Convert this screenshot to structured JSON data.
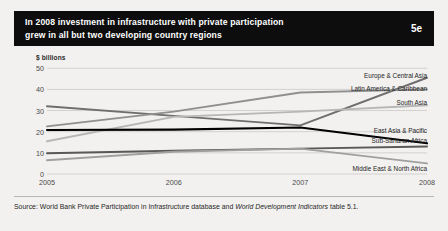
{
  "header": {
    "title": "In 2008 investment in infrastructure with private participation\ngrew in all but two developing country regions",
    "badge": "5e"
  },
  "footer": {
    "source_prefix": "Source: World Bank Private Participation in Infrastructure database and ",
    "source_italic": "World Development Indicators",
    "source_suffix": " table 5.1."
  },
  "colors": {
    "page_background": "#f2f1ef",
    "banner": "#0d0d0d",
    "gridline": "#d3d1ce",
    "axis_text": "#4a4a4a",
    "east_asia_pacific": "#000000",
    "europe_central_asia": "#6e6e6e",
    "latin_america_caribbean": "#8f8f8f",
    "south_asia": "#b6b6b6",
    "sub_saharan_africa": "#585858",
    "middle_east_north_africa": "#a0a0a0"
  },
  "chart_data": {
    "type": "line",
    "title": "In 2008 investment in infrastructure with private participation grew in all but two developing country regions",
    "xlabel": "",
    "ylabel": "$ billions",
    "x": [
      2005,
      2006,
      2007,
      2008
    ],
    "xticklabels": [
      "2005",
      "2006",
      "2007",
      "2008"
    ],
    "yticks": [
      0,
      10,
      20,
      30,
      40,
      50
    ],
    "yticklabels": [
      "0",
      "10",
      "20",
      "30",
      "40",
      "50"
    ],
    "ylim": [
      0,
      52
    ],
    "grid": true,
    "legend_position": "inline-right-of-line-ends",
    "series": [
      {
        "name": "Europe & Central Asia",
        "label": "Europe & Central Asia",
        "color": "#6e6e6e",
        "values": [
          32.0,
          27.5,
          23.0,
          45.5
        ],
        "label_y_value": 47.0
      },
      {
        "name": "Latin America & Caribbean",
        "label": "Latin America & Caribbean",
        "color": "#8f8f8f",
        "values": [
          22.5,
          29.5,
          38.5,
          40.0
        ],
        "label_y_value": 40.5
      },
      {
        "name": "South Asia",
        "label": "South Asia",
        "color": "#b6b6b6",
        "values": [
          15.5,
          27.0,
          29.5,
          32.5
        ],
        "label_y_value": 34.0
      },
      {
        "name": "East Asia & Pacific",
        "label": "East Asia & Pacific",
        "color": "#000000",
        "values": [
          20.8,
          21.0,
          22.0,
          14.5
        ],
        "label_y_value": 21.0
      },
      {
        "name": "Sub-Saharan Africa",
        "label": "Sub-Saharan Africa",
        "color": "#585858",
        "values": [
          9.8,
          11.0,
          12.0,
          13.0
        ],
        "label_y_value": 16.2
      },
      {
        "name": "Middle East & North Africa",
        "label": "Middle East & North Africa",
        "color": "#a0a0a0",
        "values": [
          6.5,
          10.5,
          12.0,
          5.0
        ],
        "label_y_value": 3.0
      }
    ]
  }
}
